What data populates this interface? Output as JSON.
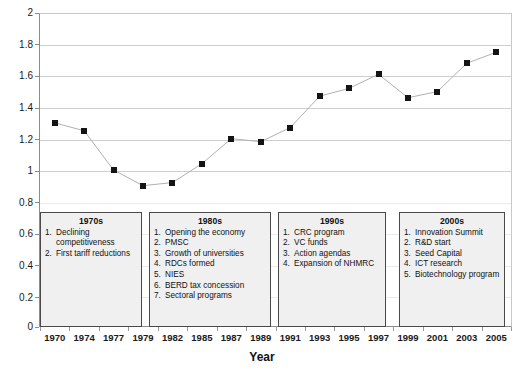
{
  "chart_data": {
    "type": "line",
    "title": "",
    "xlabel": "Year",
    "ylabel": "",
    "ylim": [
      0,
      2
    ],
    "ytick_step": 0.2,
    "grid": true,
    "legend": "none",
    "marker": "filled-square",
    "series_color": "#141414",
    "line_color": "#b0b0b0",
    "categories": [
      "1970",
      "1974",
      "1977",
      "1979",
      "1982",
      "1985",
      "1987",
      "1989",
      "1991",
      "1993",
      "1995",
      "1997",
      "1999",
      "2001",
      "2003",
      "2005"
    ],
    "values": [
      1.3,
      1.25,
      1.0,
      0.9,
      0.92,
      1.04,
      1.2,
      1.18,
      1.27,
      1.47,
      1.52,
      1.61,
      1.46,
      1.5,
      1.68,
      1.75
    ],
    "ytick_labels": [
      "0",
      "0.2",
      "0.4",
      "0.6",
      "0.8",
      "1",
      "1.2",
      "1.4",
      "1.6",
      "1.8",
      "2"
    ],
    "annotations": [
      {
        "title": "1970s",
        "items": [
          "Declining competitiveness",
          "First tariff reductions"
        ]
      },
      {
        "title": "1980s",
        "items": [
          "Opening the economy",
          "PMSC",
          "Growth of universities",
          "RDCs formed",
          "NIES",
          "BERD tax concession",
          "Sectoral programs"
        ]
      },
      {
        "title": "1990s",
        "items": [
          "CRC program",
          "VC funds",
          "Action agendas",
          "Expansion of NHMRC"
        ]
      },
      {
        "title": "2000s",
        "items": [
          "Innovation Summit",
          "R&D start",
          "Seed Capital",
          "ICT research",
          "Biotechnology program"
        ]
      }
    ]
  }
}
